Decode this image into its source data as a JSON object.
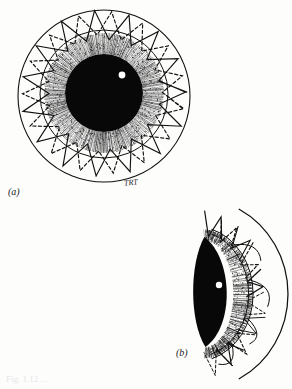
{
  "figure": {
    "background_color": "#fdfdfc",
    "ink_color": "#101010",
    "panels": [
      {
        "id": "a",
        "label": "(a)",
        "view": "frontal view",
        "description": "Circular frontal view: outer sphere circle, inner corneal circle, radial stippled iris, solid black central pupil with a single white specular highlight, and two interleaved zigzag star rings (one solid-stroke, one dashed-stroke).",
        "artist_signature": "TRT",
        "geometry": {
          "outer_circle": {
            "cx": 104,
            "cy": 96,
            "r": 86
          },
          "mid_circle": {
            "cx": 104,
            "cy": 94,
            "r": 64
          },
          "iris_outer_r": 60,
          "pupil": {
            "cx": 104,
            "cy": 93,
            "r": 39
          },
          "highlight": {
            "cx": 122,
            "cy": 75,
            "r": 3.4
          },
          "zigzag_points": 15,
          "zigzag_solid": {
            "inner_r": 55,
            "outer_r": 83
          },
          "zigzag_dashed": {
            "inner_r": 57,
            "outer_r": 80
          }
        }
      },
      {
        "id": "b",
        "label": "(b)",
        "view": "lateral sectional view",
        "description": "Right-facing crescent section: large outer arc of the sphere, a lens-shaped solid black pupil seen obliquely with a white highlight, a stippled iris crescent, a hatched limbal band, and scattered zigzag appendages.",
        "geometry": {
          "outer_arc": {
            "cx": 196,
            "cy": 294,
            "rx": 92,
            "ry": 96,
            "start_deg": -62,
            "end_deg": 62
          },
          "iris_band": {
            "cx": 196,
            "cy": 294,
            "rx": 56,
            "ry": 66
          },
          "pupil_lens": {
            "cx": 212,
            "cy": 292,
            "rx": 22,
            "ry": 55
          },
          "highlight": {
            "cx": 219,
            "cy": 285,
            "r": 3.2
          }
        }
      }
    ],
    "caption_faint": "Fig. 1.12 ...",
    "colors": {
      "ink": "#101010",
      "paper": "#fdfdfc",
      "highlight": "#ffffff",
      "stipple": "#2b2b2b",
      "faint_caption": "#eaeaea"
    }
  }
}
